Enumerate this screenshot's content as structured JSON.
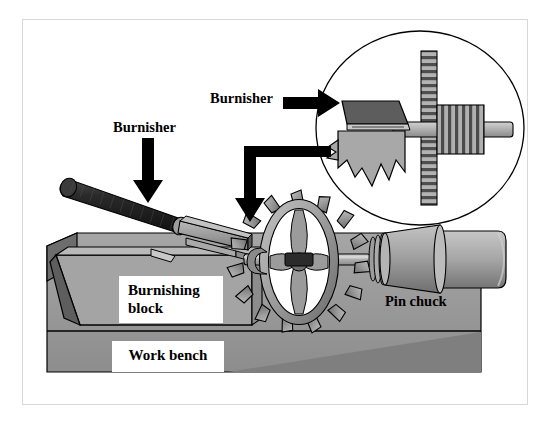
{
  "figure": {
    "background_color": "#ffffff",
    "frame_color": "#d8d8d8"
  },
  "labels": {
    "burnisher_left": "Burnisher",
    "burnisher_top": "Burnisher",
    "burnishing_block": "Burnishing\nblock",
    "burnishing_block_line1": "Burnishing",
    "burnishing_block_line2": "block",
    "work_bench": "Work bench",
    "pin_chuck": "Pin chuck"
  },
  "palette": {
    "outline": "#000000",
    "handle_dark": "#231f20",
    "blade_gray": "#8e8e8e",
    "blade_dark_gray": "#5c5c5c",
    "block_gray": "#a0a0a0",
    "block_shadow": "#6e6e6e",
    "bench_gray": "#9a9a9a",
    "wheel_gray": "#9b9b9b",
    "chuck_gray": "#a8a8a8",
    "chuck_dark": "#7a7a7a",
    "arbor_gray": "#b4b4b4",
    "label_box_fill": "#ffffff"
  },
  "parts": [
    {
      "name": "burnisher",
      "description": "hand burnisher with dark knurled handle and flat steel blade"
    },
    {
      "name": "burnishing-block",
      "description": "grey trapezoidal block set on the bench"
    },
    {
      "name": "work-bench",
      "description": "grey bench top supporting the burnishing block"
    },
    {
      "name": "escape-wheel",
      "description": "toothed wheel on an arbor held in the pin chuck"
    },
    {
      "name": "pin-chuck",
      "description": "tapered pin chuck gripping the arbor"
    },
    {
      "name": "detail-circle",
      "description": "magnified inset showing burnisher blade against pinion and wheel"
    }
  ],
  "arrows": [
    {
      "name": "arrow-burnisher-left",
      "direction": "down",
      "points_to": "burnisher-blade"
    },
    {
      "name": "arrow-burnisher-top",
      "direction": "right",
      "points_to": "detail-circle-blade"
    },
    {
      "name": "arrow-detail-to-wheel",
      "direction": "elbow-down",
      "points_to": "escape-wheel"
    }
  ],
  "detail_inset": {
    "shape": "ellipse",
    "contents": [
      "burnisher-blade",
      "wheel-rim",
      "pinion",
      "arbor"
    ]
  }
}
